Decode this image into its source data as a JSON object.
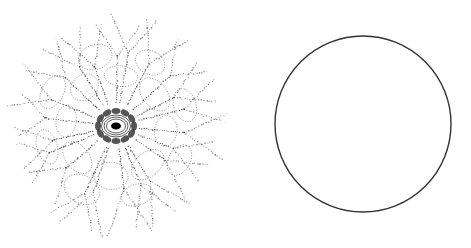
{
  "figures": [
    {
      "id": "left",
      "subject": "stippled radial network drawing",
      "center": [
        116,
        126
      ],
      "outer_radius": 105,
      "core": {
        "rx": 7,
        "ry": 5,
        "rings": 3,
        "cells": 12
      },
      "branches": 22,
      "ink_color": "#2a2a2a"
    },
    {
      "id": "right",
      "subject": "circle outline",
      "center": [
        123,
        124
      ],
      "radius": 88,
      "stroke_color": "#333333",
      "stroke_width": 1.4
    }
  ],
  "background": "#ffffff"
}
